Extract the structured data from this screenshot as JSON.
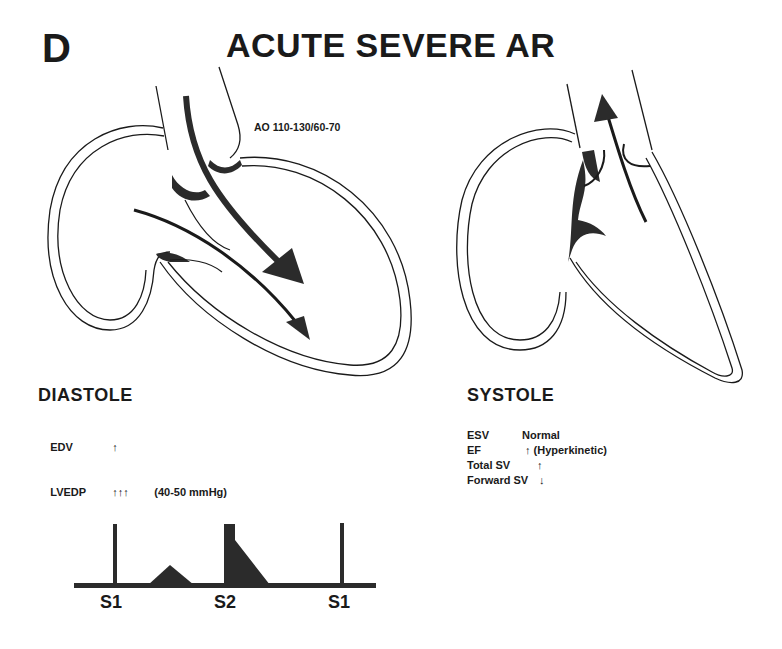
{
  "panel_letter": "D",
  "title": "ACUTE SEVERE AR",
  "aortic_pressure_label": "AO 110-130/60-70",
  "diastole": {
    "heading": "DIASTOLE",
    "rows": [
      {
        "label": "EDV",
        "value": "↑",
        "note": ""
      },
      {
        "label": "LVEDP",
        "value": "↑↑↑",
        "note": "(40-50 mmHg)"
      }
    ]
  },
  "systole": {
    "heading": "SYSTOLE",
    "rows": [
      {
        "label": "ESV",
        "value": "Normal"
      },
      {
        "label": "EF",
        "value": "↑ (Hyperkinetic)"
      },
      {
        "label": "Total SV",
        "value": "↑"
      },
      {
        "label": "Forward SV",
        "value": "↓"
      }
    ]
  },
  "phonocardiogram": {
    "labels": [
      "S1",
      "S2",
      "S1"
    ],
    "murmurs": [
      "systolic-ejection-murmur",
      "early-diastolic-decrescendo-murmur"
    ]
  },
  "colors": {
    "ink": "#1a1a1a",
    "fill": "#2b2b2b",
    "background": "#ffffff"
  }
}
